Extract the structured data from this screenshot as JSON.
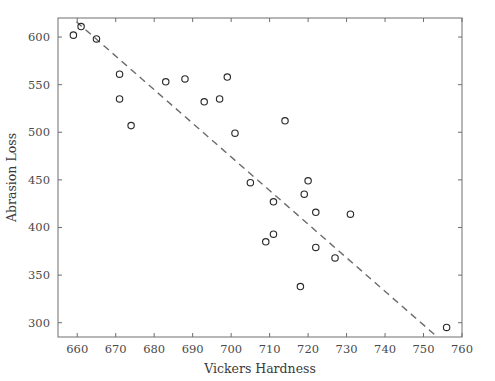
{
  "chart_data": {
    "type": "scatter",
    "title": "",
    "xlabel": "Vickers Hardness",
    "ylabel": "Abrasion Loss",
    "xlim": [
      655,
      760
    ],
    "ylim": [
      285,
      620
    ],
    "xticks": [
      660,
      670,
      680,
      690,
      700,
      710,
      720,
      730,
      740,
      750,
      760
    ],
    "yticks": [
      300,
      350,
      400,
      450,
      500,
      550,
      600
    ],
    "grid": false,
    "legend": null,
    "marker_style": "open-circle",
    "marker_color": "#2b2b2b",
    "points": [
      {
        "x": 659,
        "y": 602
      },
      {
        "x": 661,
        "y": 611
      },
      {
        "x": 665,
        "y": 598
      },
      {
        "x": 671,
        "y": 561
      },
      {
        "x": 671,
        "y": 535
      },
      {
        "x": 674,
        "y": 507
      },
      {
        "x": 683,
        "y": 553
      },
      {
        "x": 688,
        "y": 556
      },
      {
        "x": 693,
        "y": 532
      },
      {
        "x": 697,
        "y": 535
      },
      {
        "x": 699,
        "y": 558
      },
      {
        "x": 701,
        "y": 499
      },
      {
        "x": 705,
        "y": 447
      },
      {
        "x": 709,
        "y": 385
      },
      {
        "x": 711,
        "y": 427
      },
      {
        "x": 711,
        "y": 393
      },
      {
        "x": 714,
        "y": 512
      },
      {
        "x": 718,
        "y": 338
      },
      {
        "x": 719,
        "y": 435
      },
      {
        "x": 720,
        "y": 449
      },
      {
        "x": 722,
        "y": 416
      },
      {
        "x": 722,
        "y": 379
      },
      {
        "x": 727,
        "y": 368
      },
      {
        "x": 731,
        "y": 414
      },
      {
        "x": 756,
        "y": 295
      }
    ],
    "fit_line": {
      "style": "dashed",
      "color": "#6b6b6b",
      "x0": 659.8,
      "y0": 616.0,
      "x1": 753.3,
      "y1": 286.0
    }
  }
}
